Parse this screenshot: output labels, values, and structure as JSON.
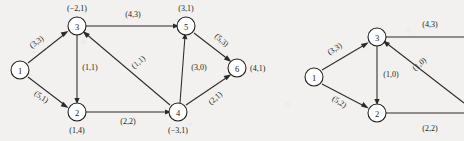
{
  "figure": {
    "background_color": "#f2f1ef",
    "ink_color": "#1c1c1c",
    "graphs": [
      {
        "id": "left-graph",
        "nodes": [
          {
            "id": "1",
            "label": "",
            "label_pos": "none",
            "x": 20,
            "y": 70
          },
          {
            "id": "2",
            "label": "(1,4)",
            "label_pos": "below",
            "x": 77,
            "y": 112
          },
          {
            "id": "3",
            "label": "(−2,1)",
            "label_pos": "above",
            "x": 77,
            "y": 26
          },
          {
            "id": "4",
            "label": "(−3,1)",
            "label_pos": "below",
            "x": 178,
            "y": 112
          },
          {
            "id": "5",
            "label": "(3,1)",
            "label_pos": "above",
            "x": 186,
            "y": 26
          },
          {
            "id": "6",
            "label": "(4,1)",
            "label_pos": "right",
            "x": 237,
            "y": 68
          }
        ],
        "edges": [
          {
            "from": "1",
            "to": "3",
            "label": "(3,3)",
            "label_x": 38,
            "label_y": 44,
            "rotate": -35
          },
          {
            "from": "1",
            "to": "2",
            "label": "(5,1)",
            "label_x": 40,
            "label_y": 99,
            "rotate": 35
          },
          {
            "from": "3",
            "to": "5",
            "label": "(4,3)",
            "label_x": 133,
            "label_y": 17,
            "rotate": 0
          },
          {
            "from": "3",
            "to": "2",
            "label": "(1,1)",
            "label_x": 90,
            "label_y": 70,
            "rotate": 0
          },
          {
            "from": "4",
            "to": "3",
            "label": "(1,1)",
            "label_x": 140,
            "label_y": 64,
            "rotate": -40
          },
          {
            "from": "2",
            "to": "4",
            "label": "(2,2)",
            "label_x": 128,
            "label_y": 124,
            "rotate": 0
          },
          {
            "from": "4",
            "to": "5",
            "label": "(3,0)",
            "label_x": 199,
            "label_y": 70,
            "rotate": 0
          },
          {
            "from": "5",
            "to": "6",
            "label": "(5,3)",
            "label_x": 220,
            "label_y": 42,
            "rotate": 42
          },
          {
            "from": "4",
            "to": "6",
            "label": "(2,1)",
            "label_x": 217,
            "label_y": 100,
            "rotate": -42
          }
        ]
      },
      {
        "id": "right-graph",
        "cropped": "true",
        "nodes": [
          {
            "id": "1",
            "label": "",
            "label_pos": "none",
            "x": 314,
            "y": 77
          },
          {
            "id": "2",
            "label": "",
            "label_pos": "none",
            "x": 377,
            "y": 113
          },
          {
            "id": "3",
            "label": "",
            "label_pos": "none",
            "x": 377,
            "y": 37
          }
        ],
        "edges": [
          {
            "from": "1",
            "to": "3",
            "label": "(3,3)",
            "label_x": 336,
            "label_y": 51,
            "rotate": -32
          },
          {
            "from": "1",
            "to": "2",
            "label": "(5,2)",
            "label_x": 338,
            "label_y": 104,
            "rotate": 32
          },
          {
            "from": "3",
            "to": "right-edge",
            "label": "(4,3)",
            "label_x": 430,
            "label_y": 27,
            "rotate": 0
          },
          {
            "from": "3",
            "to": "2",
            "label": "(1,0)",
            "label_x": 391,
            "label_y": 77,
            "rotate": 0
          },
          {
            "from": "right-edge",
            "to": "3",
            "label": "(1,0)",
            "label_x": 421,
            "label_y": 66,
            "rotate": -40
          },
          {
            "from": "2",
            "to": "right-edge",
            "label": "(2,2)",
            "label_x": 430,
            "label_y": 131,
            "rotate": 0
          }
        ]
      }
    ]
  }
}
